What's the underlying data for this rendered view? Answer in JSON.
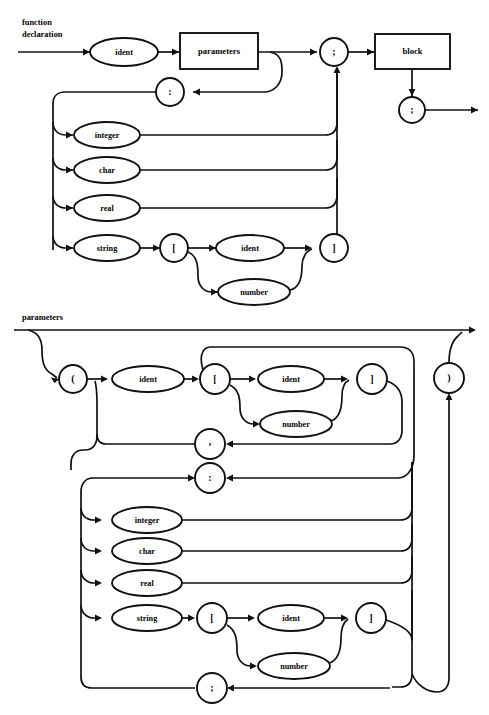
{
  "page": {
    "kind": "syntax-railroad-diagrams",
    "width": 489,
    "height": 715,
    "background_color": "#ffffff",
    "ink_color": "#111111"
  },
  "diagrams": [
    {
      "id": "function-declaration",
      "title_line1": "function",
      "title_line2": "declaration",
      "nodes": {
        "ident_top": "ident",
        "parameters_box": "parameters",
        "semicolon_mid": ";",
        "block_box": "block",
        "semicolon_end": ";",
        "colon": ":",
        "integer": "integer",
        "char": "char",
        "real": "real",
        "string": "string",
        "lbracket": "[",
        "ident_idx": "ident",
        "number": "number",
        "rbracket": "]"
      }
    },
    {
      "id": "parameters",
      "title_line1": "parameters",
      "title_line2": "",
      "nodes": {
        "lparen": "(",
        "ident_name": "ident",
        "lbracket": "[",
        "ident_idx": "ident",
        "number_idx": "number",
        "rbracket": "]",
        "comma": ",",
        "colon": ":",
        "integer": "integer",
        "char": "char",
        "real": "real",
        "string": "string",
        "lbracket2": "[",
        "ident_idx2": "ident",
        "number_idx2": "number",
        "rbracket2": "]",
        "semicolon": ";",
        "rparen": ")"
      }
    }
  ]
}
